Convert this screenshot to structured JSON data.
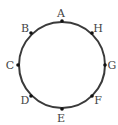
{
  "diagram": {
    "type": "circle-with-labeled-points",
    "circle": {
      "cx": 62,
      "cy": 65,
      "r": 43,
      "stroke": "#3a3a3a",
      "stroke_width": 2
    },
    "point_color": "#111111",
    "label_color": "#444444",
    "points": [
      {
        "name": "A",
        "x": 62,
        "y": 21,
        "lx": 61,
        "ly": 14
      },
      {
        "name": "H",
        "x": 92,
        "y": 33,
        "lx": 98,
        "ly": 29
      },
      {
        "name": "G",
        "x": 105,
        "y": 65,
        "lx": 112,
        "ly": 66
      },
      {
        "name": "F",
        "x": 92,
        "y": 96,
        "lx": 98,
        "ly": 101
      },
      {
        "name": "E",
        "x": 62,
        "y": 109,
        "lx": 61,
        "ly": 119
      },
      {
        "name": "D",
        "x": 31,
        "y": 96,
        "lx": 25,
        "ly": 101
      },
      {
        "name": "C",
        "x": 18,
        "y": 65,
        "lx": 10,
        "ly": 66
      },
      {
        "name": "B",
        "x": 31,
        "y": 33,
        "lx": 25,
        "ly": 29
      }
    ]
  }
}
